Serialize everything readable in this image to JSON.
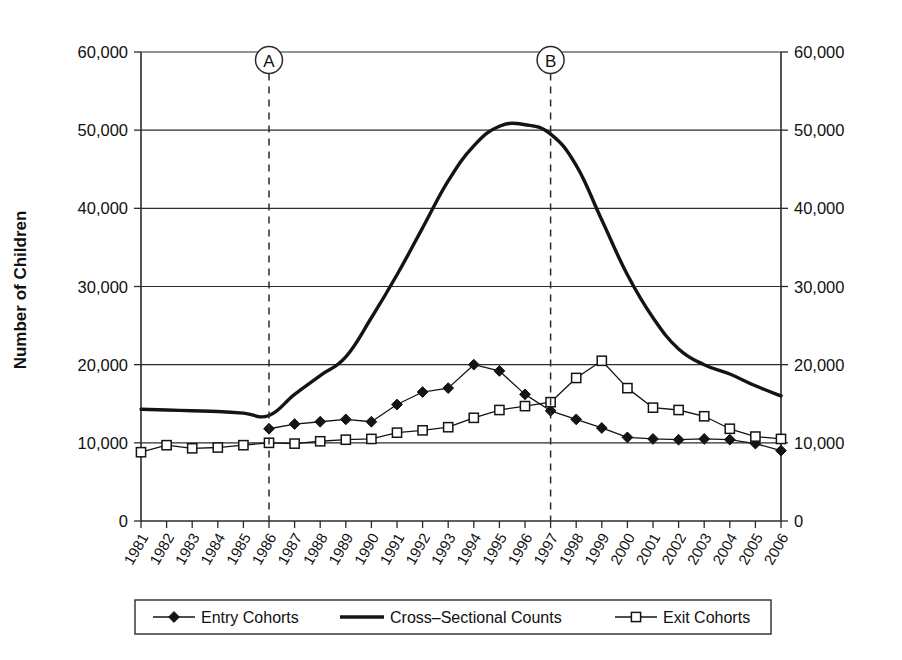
{
  "chart_data": {
    "type": "line",
    "title": "",
    "xlabel": "",
    "ylabel": "Number of Children",
    "ylim": [
      0,
      60000
    ],
    "ytick_values": [
      0,
      10000,
      20000,
      30000,
      40000,
      50000,
      60000
    ],
    "ytick_labels": [
      "0",
      "10,000",
      "20,000",
      "30,000",
      "40,000",
      "50,000",
      "60,000"
    ],
    "right_axis": true,
    "right_ytick_labels": [
      "0",
      "10,000",
      "20,000",
      "30,000",
      "40,000",
      "50,000",
      "60,000"
    ],
    "grid": "horizontal",
    "legend_position": "bottom",
    "categories": [
      "1981",
      "1982",
      "1983",
      "1984",
      "1985",
      "1986",
      "1987",
      "1988",
      "1989",
      "1990",
      "1991",
      "1992",
      "1993",
      "1994",
      "1995",
      "1996",
      "1997",
      "1998",
      "1999",
      "2000",
      "2001",
      "2002",
      "2003",
      "2004",
      "2005",
      "2006"
    ],
    "series": [
      {
        "name": "Entry Cohorts",
        "marker": "filled-diamond",
        "line_width": "thin",
        "values": [
          null,
          null,
          null,
          null,
          null,
          11800,
          12400,
          12700,
          13000,
          12700,
          14900,
          16500,
          17000,
          20000,
          19200,
          16200,
          14100,
          13000,
          11900,
          10700,
          10500,
          10400,
          10500,
          10400,
          9900,
          9000
        ]
      },
      {
        "name": "Cross-Sectional Counts",
        "marker": "none",
        "line_width": "thick",
        "values": [
          14300,
          14200,
          14100,
          14000,
          13800,
          13500,
          16200,
          18600,
          21000,
          26000,
          31500,
          37500,
          43500,
          48000,
          50500,
          50700,
          49500,
          45500,
          38500,
          31500,
          26000,
          22000,
          20000,
          18800,
          17300,
          16000
        ]
      },
      {
        "name": "Exit Cohorts",
        "marker": "open-square",
        "line_width": "thin",
        "values": [
          8800,
          9700,
          9300,
          9400,
          9700,
          10000,
          9900,
          10200,
          10400,
          10500,
          11300,
          11600,
          12000,
          13200,
          14200,
          14700,
          15200,
          18300,
          20500,
          17000,
          14500,
          14200,
          13400,
          11800,
          10800,
          10500
        ]
      }
    ],
    "annotations": [
      {
        "label": "A",
        "at_category": "1986",
        "style": "circled-dashed-vertical"
      },
      {
        "label": "B",
        "at_category": "1997",
        "style": "circled-dashed-vertical"
      }
    ],
    "legend": [
      {
        "label": "Entry Cohorts",
        "marker": "filled-diamond",
        "line": "thin"
      },
      {
        "label": "Cross–Sectional Counts",
        "marker": "none",
        "line": "thick"
      },
      {
        "label": "Exit Cohorts",
        "marker": "open-square",
        "line": "thin"
      }
    ],
    "colors": {
      "series": "#141414",
      "axis": "#2b2b2b",
      "grid": "#2b2b2b",
      "background": "#ffffff"
    }
  }
}
